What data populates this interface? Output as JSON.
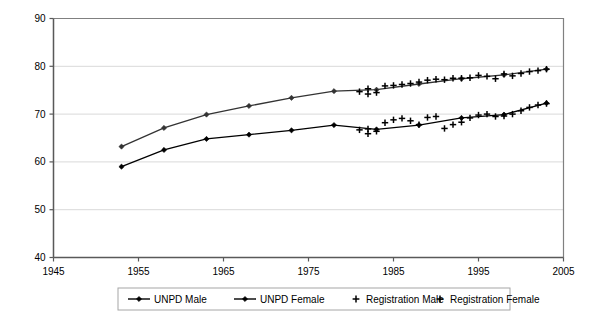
{
  "chart_data": {
    "type": "line",
    "title": "",
    "xlabel": "",
    "ylabel": "",
    "xlim": [
      1945,
      2005
    ],
    "ylim": [
      40,
      90
    ],
    "xticks": [
      1945,
      1955,
      1965,
      1975,
      1985,
      1995,
      2005
    ],
    "yticks": [
      40,
      50,
      60,
      70,
      80,
      90
    ],
    "grid": "horizontal",
    "legend_position": "bottom",
    "series": [
      {
        "name": "UNPD Male",
        "style": "line-with-diamond-markers",
        "color": "#000000",
        "x": [
          1953,
          1958,
          1963,
          1968,
          1973,
          1978,
          1983,
          1988,
          1993,
          1998,
          2003
        ],
        "y": [
          59.0,
          62.5,
          64.8,
          65.7,
          66.6,
          67.7,
          66.8,
          67.7,
          69.2,
          69.9,
          72.3
        ]
      },
      {
        "name": "UNPD Female",
        "style": "line-with-diamond-markers",
        "color": "#333333",
        "x": [
          1953,
          1958,
          1963,
          1968,
          1973,
          1978,
          1983,
          1988,
          1993,
          1998,
          2003
        ],
        "y": [
          63.2,
          67.1,
          69.9,
          71.7,
          73.4,
          74.8,
          75.1,
          76.3,
          77.4,
          78.2,
          79.4
        ]
      },
      {
        "name": "Registration Male",
        "style": "plus-markers",
        "color": "#000000",
        "x": [
          1981,
          1982,
          1982,
          1983,
          1984,
          1985,
          1986,
          1987,
          1988,
          1989,
          1990,
          1991,
          1992,
          1993,
          1994,
          1995,
          1996,
          1997,
          1998,
          1999,
          2000,
          2001,
          2002,
          2003
        ],
        "y": [
          66.7,
          66.9,
          65.9,
          66.4,
          68.2,
          68.8,
          69.1,
          68.6,
          67.8,
          69.3,
          69.5,
          67.0,
          67.8,
          68.3,
          69.2,
          69.8,
          70.0,
          69.5,
          69.6,
          70.0,
          70.7,
          71.4,
          71.9,
          72.2
        ]
      },
      {
        "name": "Registration Female",
        "style": "plus-markers",
        "color": "#000000",
        "x": [
          1981,
          1982,
          1982,
          1983,
          1984,
          1985,
          1986,
          1987,
          1988,
          1989,
          1990,
          1991,
          1992,
          1993,
          1994,
          1995,
          1996,
          1997,
          1998,
          1999,
          2000,
          2001,
          2002,
          2003
        ],
        "y": [
          74.7,
          75.3,
          74.2,
          74.5,
          75.9,
          76.0,
          76.2,
          76.4,
          76.7,
          77.1,
          77.3,
          77.2,
          77.5,
          77.5,
          77.6,
          78.1,
          77.9,
          77.4,
          78.4,
          78.0,
          78.5,
          78.9,
          79.1,
          79.4
        ]
      }
    ]
  },
  "legend": {
    "items": [
      {
        "label": "UNPD Male",
        "marker": "line-diamond"
      },
      {
        "label": "UNPD Female",
        "marker": "line-diamond"
      },
      {
        "label": "Registration Male",
        "marker": "plus"
      },
      {
        "label": "Registration Female",
        "marker": "plus"
      }
    ]
  }
}
